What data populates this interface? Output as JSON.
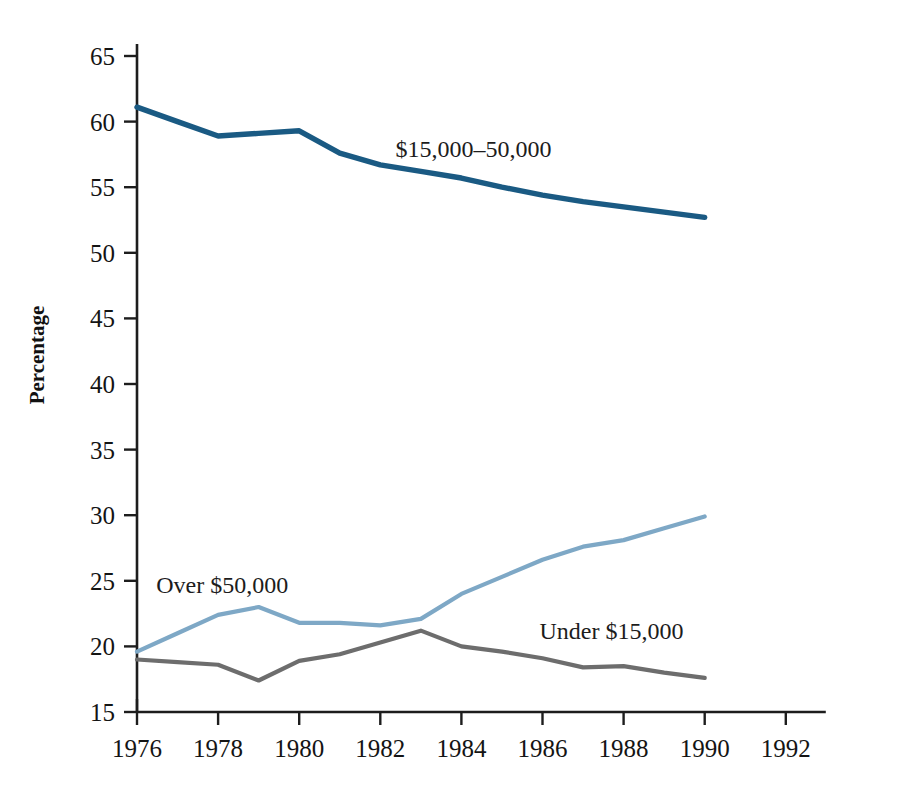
{
  "chart_data": {
    "type": "line",
    "title": "",
    "xlabel": "",
    "ylabel": "Percentage",
    "xlim": [
      1976,
      1992
    ],
    "ylim": [
      15,
      65
    ],
    "grid": false,
    "legend_position": "inline-labels",
    "x_ticks": [
      "1976",
      "1978",
      "1980",
      "1982",
      "1984",
      "1986",
      "1988",
      "1990",
      "1992"
    ],
    "y_ticks": [
      "15",
      "20",
      "25",
      "30",
      "35",
      "40",
      "45",
      "50",
      "55",
      "60",
      "65"
    ],
    "x": [
      1976,
      1977,
      1978,
      1979,
      1980,
      1981,
      1982,
      1983,
      1984,
      1985,
      1986,
      1987,
      1988,
      1989,
      1990
    ],
    "series": [
      {
        "name": "$15,000–50,000",
        "color": "#1a5a83",
        "label_x": 1984.3,
        "label_y": 57.3,
        "values": [
          61.1,
          60.0,
          58.9,
          59.1,
          59.3,
          57.6,
          56.7,
          56.2,
          55.7,
          55.0,
          54.4,
          53.9,
          53.5,
          53.1,
          52.7
        ]
      },
      {
        "name": "Over $50,000",
        "color": "#7ea8c6",
        "label_x": 1978.1,
        "label_y": 24.1,
        "values": [
          19.6,
          21.0,
          22.4,
          23.0,
          21.8,
          21.8,
          21.6,
          22.1,
          24.0,
          25.3,
          26.6,
          27.6,
          28.1,
          29.0,
          29.9
        ]
      },
      {
        "name": "Under $15,000",
        "color": "#6d6d6d",
        "label_x": 1987.7,
        "label_y": 20.6,
        "values": [
          19.0,
          18.8,
          18.6,
          17.4,
          18.9,
          19.4,
          20.3,
          21.2,
          20.0,
          19.6,
          19.1,
          18.4,
          18.5,
          18.0,
          17.6
        ]
      }
    ]
  }
}
